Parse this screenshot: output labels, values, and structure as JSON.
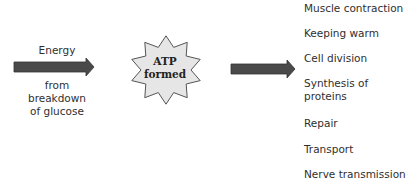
{
  "input": {
    "label_top": "Energy",
    "label_bottom_lines": [
      "from",
      "breakdown",
      "of glucose"
    ]
  },
  "center": {
    "lines": [
      "ATP",
      "formed"
    ],
    "shape": "starburst",
    "fill_color": "#e6e6e6",
    "stroke_color": "#555555"
  },
  "arrows": {
    "color": "#4a4a4a"
  },
  "uses": [
    {
      "label": "Muscle contraction",
      "lines": [
        "Muscle contraction"
      ]
    },
    {
      "label": "Keeping warm",
      "lines": [
        "Keeping warm"
      ]
    },
    {
      "label": "Cell division",
      "lines": [
        "Cell division"
      ]
    },
    {
      "label": "Synthesis of proteins",
      "lines": [
        "Synthesis of",
        "proteins"
      ]
    },
    {
      "label": "Repair",
      "lines": [
        "Repair"
      ]
    },
    {
      "label": "Transport",
      "lines": [
        "Transport"
      ]
    },
    {
      "label": "Nerve transmission",
      "lines": [
        "Nerve transmission"
      ]
    }
  ]
}
